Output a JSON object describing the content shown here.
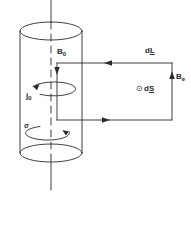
{
  "figure": {
    "background_color": "#ffffff",
    "stroke_color": "#2b2b2b",
    "labels": {
      "b_axis": "B",
      "b_axis_sub": "0",
      "current_density": "j",
      "current_density_sub": "0",
      "surface_charge": "σ",
      "line_element": "d",
      "line_element_vec": "L",
      "b_external": "B",
      "b_external_sub": "e",
      "area_element_dot": "⊙",
      "area_element": "d",
      "area_element_vec": "S"
    },
    "shapes": {
      "cylinder": {
        "center_x": 51,
        "top_ellipse_cy": 31,
        "bottom_ellipse_cy": 153,
        "rx": 31,
        "ry": 9
      },
      "axis": {
        "x": 51,
        "top_y": 0,
        "bottom_y": 190,
        "dashed_inside": true
      },
      "loop_rect": {
        "left": 57,
        "top": 63,
        "right": 172,
        "bottom": 120
      },
      "rotation_arcs": [
        {
          "cy": 88,
          "rx": 22,
          "ry": 7,
          "arrow": "left"
        },
        {
          "cy": 131,
          "rx": 22,
          "ry": 7,
          "arrow": "right"
        }
      ],
      "loop_arrows": [
        {
          "edge": "top",
          "x": 108,
          "y": 63,
          "direction": "left"
        },
        {
          "edge": "right",
          "x": 172,
          "y": 76,
          "direction": "up"
        },
        {
          "edge": "bottom",
          "x": 106,
          "y": 120,
          "direction": "right"
        },
        {
          "edge": "left",
          "x": 57,
          "y": 78,
          "direction": "down"
        }
      ]
    }
  }
}
